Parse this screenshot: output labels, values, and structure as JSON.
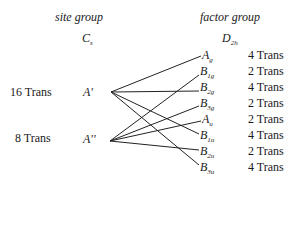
{
  "site_group": {
    "title": "site group",
    "symbol": "C",
    "symbol_sub": "s",
    "species": [
      {
        "label": "A'",
        "count": "16 Trans"
      },
      {
        "label": "A''",
        "count": "8 Trans"
      }
    ]
  },
  "factor_group": {
    "title": "factor group",
    "symbol": "D",
    "symbol_sub": "2h",
    "species": [
      {
        "base": "A",
        "sub": "g",
        "count": "4 Trans"
      },
      {
        "base": "B",
        "sub": "1g",
        "count": "2 Trans"
      },
      {
        "base": "B",
        "sub": "2g",
        "count": "4 Trans"
      },
      {
        "base": "B",
        "sub": "3g",
        "count": "2 Trans"
      },
      {
        "base": "A",
        "sub": "u",
        "count": "2 Trans"
      },
      {
        "base": "B",
        "sub": "1u",
        "count": "4 Trans"
      },
      {
        "base": "B",
        "sub": "2u",
        "count": "2 Trans"
      },
      {
        "base": "B",
        "sub": "3u",
        "count": "4 Trans"
      }
    ]
  },
  "correlations": [
    {
      "from": "A'",
      "to": [
        "Ag",
        "B2g",
        "B1u",
        "B3u"
      ]
    },
    {
      "from": "A''",
      "to": [
        "B1g",
        "B3g",
        "Au",
        "B2u"
      ]
    }
  ]
}
